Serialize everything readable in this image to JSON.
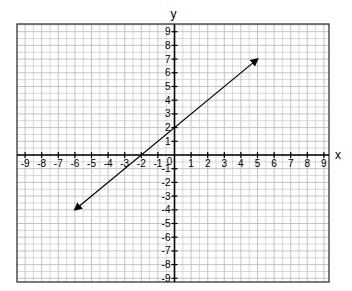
{
  "chart_data": {
    "type": "line",
    "title": "",
    "xlabel": "x",
    "ylabel": "y",
    "xlim": [
      -9.5,
      9.5
    ],
    "ylim": [
      -9.4,
      9.4
    ],
    "grid": true,
    "x_ticks": [
      -9,
      -8,
      -7,
      -6,
      -5,
      -4,
      -3,
      -2,
      -1,
      0,
      1,
      2,
      3,
      4,
      5,
      6,
      7,
      8,
      9
    ],
    "y_ticks": [
      -9,
      -8,
      -7,
      -6,
      -5,
      -4,
      -3,
      -2,
      -1,
      1,
      2,
      3,
      4,
      5,
      6,
      7,
      8,
      9
    ],
    "origin_label": "0",
    "series": [
      {
        "name": "line",
        "equation": "y = x + 2",
        "points": [
          [
            -6,
            -4
          ],
          [
            5,
            7
          ]
        ],
        "arrows": "both",
        "color": "#000000"
      }
    ]
  },
  "colors": {
    "grid": "#bdbdbd",
    "axis": "#000000",
    "frame": "#333333"
  }
}
